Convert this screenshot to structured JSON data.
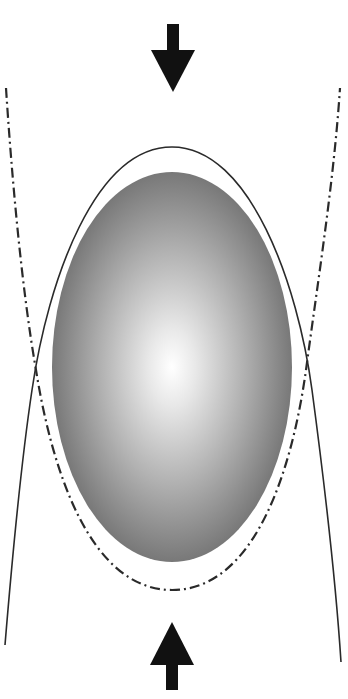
{
  "diagram": {
    "type": "compression-deformation-diagram",
    "canvas": {
      "width": 348,
      "height": 699,
      "background": "#ffffff"
    },
    "colors": {
      "stroke": "#2a2a2a",
      "arrow_fill": "#111111",
      "ellipse_center": "#ffffff",
      "ellipse_mid": "#b4b4b4",
      "ellipse_edge": "#6e6e6e"
    },
    "elements": {
      "top_arrow": {
        "direction": "down",
        "icon": "arrow-down-icon",
        "center_x": 173,
        "tip_y": 92,
        "head_top_y": 50,
        "head_half_width": 22,
        "shaft_top_y": 24,
        "shaft_half_width": 6
      },
      "bottom_arrow": {
        "direction": "up",
        "icon": "arrow-up-icon",
        "center_x": 172,
        "tip_y": 622,
        "head_bottom_y": 664,
        "head_half_width": 22,
        "shaft_bottom_y": 690,
        "shaft_half_width": 6
      },
      "shaded_ellipse": {
        "cx": 172,
        "cy": 367,
        "rx": 120,
        "ry": 195
      },
      "solid_curve": {
        "style": "solid",
        "label": "elongated-vertical-profile",
        "apex_y": 147
      },
      "dashdot_curve": {
        "style": "dash-dot",
        "label": "compressed-profile",
        "bottom_y": 590
      }
    }
  }
}
